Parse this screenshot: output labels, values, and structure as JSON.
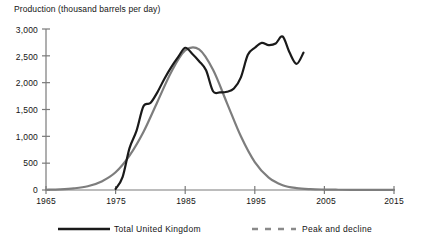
{
  "chart_data": {
    "type": "line",
    "title": "Production (thousand barrels per day)",
    "xlabel": "",
    "ylabel": "Production (thousand barrels per day)",
    "xlim": [
      1965,
      2015
    ],
    "ylim": [
      0,
      3000
    ],
    "grid": false,
    "legend_position": "bottom",
    "xticks": [
      1965,
      1975,
      1985,
      1995,
      2005,
      2015
    ],
    "xtick_labels": [
      "1965",
      "1975",
      "1985",
      "1995",
      "2005",
      "2015"
    ],
    "yticks": [
      0,
      500,
      1000,
      1500,
      2000,
      2500,
      3000
    ],
    "ytick_labels": [
      "0",
      "500",
      "1,000",
      "1,500",
      "2,000",
      "2,500",
      "3,000"
    ],
    "series": [
      {
        "name": "Total United Kingdom",
        "style": "solid",
        "color": "#1a1a1a",
        "width": 2.2,
        "x": [
          1975,
          1976,
          1977,
          1978,
          1979,
          1980,
          1981,
          1982,
          1983,
          1984,
          1985,
          1986,
          1987,
          1988,
          1989,
          1990,
          1991,
          1992,
          1993,
          1994,
          1995,
          1996,
          1997,
          1998,
          1999,
          2000,
          2001,
          2002
        ],
        "values": [
          20,
          240,
          780,
          1100,
          1560,
          1620,
          1820,
          2070,
          2290,
          2480,
          2650,
          2540,
          2400,
          2230,
          1840,
          1820,
          1830,
          1890,
          2100,
          2520,
          2650,
          2740,
          2700,
          2730,
          2860,
          2560,
          2350,
          2560
        ]
      },
      {
        "name": "Peak and decline",
        "style": "dashed",
        "color": "#7d7d7d",
        "width": 2.2,
        "x": [
          1965,
          1967,
          1969,
          1971,
          1973,
          1975,
          1977,
          1979,
          1981,
          1983,
          1985,
          1987,
          1989,
          1991,
          1993,
          1995,
          1997,
          1999,
          2001,
          2003,
          2005,
          2007,
          2009,
          2011,
          2013,
          2015
        ],
        "values": [
          5,
          12,
          30,
          70,
          160,
          330,
          640,
          1080,
          1640,
          2200,
          2600,
          2620,
          2240,
          1620,
          1000,
          520,
          230,
          90,
          35,
          15,
          8,
          5,
          3,
          2,
          2,
          2
        ]
      }
    ],
    "legend": [
      {
        "label": "Total United Kingdom",
        "style": "solid",
        "color": "#1a1a1a"
      },
      {
        "label": "Peak and decline",
        "style": "dashed",
        "color": "#7d7d7d"
      }
    ]
  }
}
